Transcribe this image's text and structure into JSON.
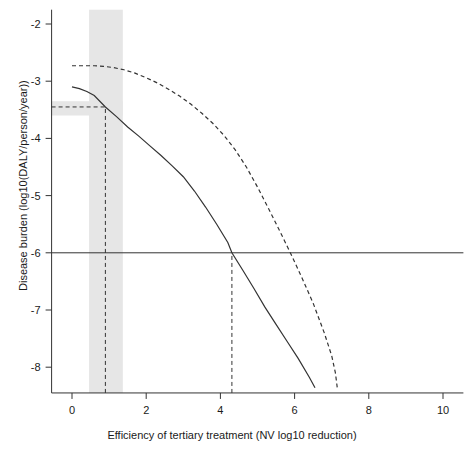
{
  "chart_data": {
    "type": "line",
    "title": "",
    "xlabel": "Efficiency of tertiary treatment (NV log10 reduction)",
    "ylabel": "Disease burden (log10(DALY/person/year))",
    "xlim": [
      -0.55,
      10.55
    ],
    "ylim": [
      -8.45,
      -1.75
    ],
    "xticks": [
      0,
      2,
      4,
      6,
      8,
      10
    ],
    "xticklabels": [
      "0",
      "2",
      "4",
      "6",
      "8",
      "10"
    ],
    "yticks": [
      -2,
      -3,
      -4,
      -5,
      -6,
      -7,
      -8
    ],
    "yticklabels": [
      "-2",
      "-3",
      "-4",
      "-5",
      "-6",
      "-7",
      "-8"
    ],
    "grid": false,
    "legend": "none",
    "series": [
      {
        "name": "upper-bound-dashed",
        "style": "dashed",
        "color": "#333333",
        "points": [
          [
            0.0,
            -2.73
          ],
          [
            0.3,
            -2.73
          ],
          [
            0.6,
            -2.73
          ],
          [
            0.85,
            -2.74
          ],
          [
            1.1,
            -2.76
          ],
          [
            1.4,
            -2.8
          ],
          [
            1.7,
            -2.86
          ],
          [
            2.0,
            -2.94
          ],
          [
            2.3,
            -3.03
          ],
          [
            2.6,
            -3.14
          ],
          [
            2.9,
            -3.26
          ],
          [
            3.2,
            -3.4
          ],
          [
            3.5,
            -3.56
          ],
          [
            3.8,
            -3.74
          ],
          [
            4.1,
            -3.95
          ],
          [
            4.4,
            -4.2
          ],
          [
            4.7,
            -4.5
          ],
          [
            5.0,
            -4.85
          ],
          [
            5.3,
            -5.23
          ],
          [
            5.6,
            -5.62
          ],
          [
            5.9,
            -6.02
          ],
          [
            6.2,
            -6.44
          ],
          [
            6.5,
            -6.88
          ],
          [
            6.8,
            -7.4
          ],
          [
            7.0,
            -7.8
          ],
          [
            7.1,
            -8.1
          ],
          [
            7.15,
            -8.36
          ]
        ]
      },
      {
        "name": "central-estimate-solid",
        "style": "solid",
        "color": "#333333",
        "points": [
          [
            0.0,
            -3.1
          ],
          [
            0.2,
            -3.13
          ],
          [
            0.4,
            -3.18
          ],
          [
            0.6,
            -3.25
          ],
          [
            0.9,
            -3.45
          ],
          [
            1.2,
            -3.62
          ],
          [
            1.5,
            -3.8
          ],
          [
            1.8,
            -3.96
          ],
          [
            2.1,
            -4.13
          ],
          [
            2.4,
            -4.3
          ],
          [
            2.7,
            -4.48
          ],
          [
            3.0,
            -4.67
          ],
          [
            3.3,
            -4.92
          ],
          [
            3.6,
            -5.2
          ],
          [
            3.9,
            -5.5
          ],
          [
            4.2,
            -5.82
          ],
          [
            4.31,
            -6.0
          ],
          [
            4.6,
            -6.3
          ],
          [
            4.9,
            -6.62
          ],
          [
            5.2,
            -6.95
          ],
          [
            5.5,
            -7.25
          ],
          [
            5.8,
            -7.55
          ],
          [
            6.1,
            -7.85
          ],
          [
            6.4,
            -8.18
          ],
          [
            6.55,
            -8.36
          ]
        ]
      }
    ],
    "reference_lines": [
      {
        "name": "who-tolerable-burden",
        "orientation": "horizontal",
        "style": "solid",
        "value": -6.0,
        "color": "#333333"
      },
      {
        "name": "baseline-burden-marker",
        "orientation": "horizontal",
        "style": "dashed",
        "value": -3.45,
        "x_from": -0.55,
        "x_to": 0.9,
        "color": "#333333"
      },
      {
        "name": "current-efficiency-marker",
        "orientation": "vertical",
        "style": "dashed",
        "value": 0.9,
        "y_from": -8.45,
        "y_to": -3.45,
        "color": "#333333"
      },
      {
        "name": "required-efficiency-marker",
        "orientation": "vertical",
        "style": "dashed",
        "value": 4.31,
        "y_from": -8.45,
        "y_to": -6.0,
        "color": "#333333"
      }
    ],
    "shaded_bands": [
      {
        "name": "efficiency-uncertainty-band",
        "orientation": "vertical",
        "from": 0.46,
        "to": 1.37,
        "color": "#e6e6e6"
      },
      {
        "name": "burden-uncertainty-band",
        "orientation": "horizontal",
        "from": -3.6,
        "to": -3.35,
        "x_from": -0.55,
        "x_to": 1.37,
        "color": "#e6e6e6"
      }
    ]
  },
  "axes": {
    "x_title": "Efficiency of tertiary treatment (NV log10 reduction)",
    "y_title": "Disease burden (log10(DALY/person/year))"
  },
  "colors": {
    "axis": "#333333",
    "line": "#333333",
    "band": "#e6e6e6",
    "background": "#ffffff"
  }
}
